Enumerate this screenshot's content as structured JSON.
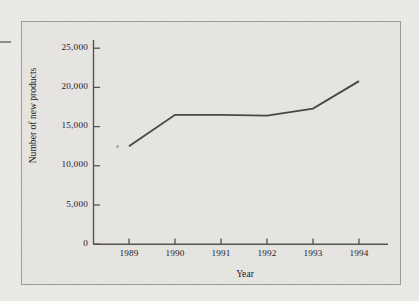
{
  "chart_data": {
    "type": "line",
    "title": "",
    "xlabel": "Year",
    "ylabel": "Number of new products",
    "categories": [
      "1989",
      "1990",
      "1991",
      "1992",
      "1993",
      "1994"
    ],
    "x": [
      1989,
      1990,
      1991,
      1992,
      1993,
      1994
    ],
    "values": [
      12500,
      16500,
      16500,
      16400,
      17300,
      20800
    ],
    "series": [
      {
        "name": "Number of new products",
        "values": [
          12500,
          16500,
          16500,
          16400,
          17300,
          20800
        ]
      }
    ],
    "ylim": [
      0,
      25000
    ],
    "ytick_values": [
      0,
      5000,
      10000,
      15000,
      20000,
      25000
    ],
    "ytick_labels": [
      "0",
      "5,000",
      "10,000",
      "15,000",
      "20,000",
      "25,000"
    ],
    "xtick_labels": [
      "1989",
      "1990",
      "1991",
      "1992",
      "1993",
      "1994"
    ],
    "grid": false,
    "legend": null,
    "legend_position": "none",
    "line_color": "#4a4845",
    "markers": false,
    "annotations": []
  },
  "figure": {
    "background_color": "#e6e4e1",
    "page_background_color": "#eceae7",
    "frame_color": "#9c9a97",
    "axis_color": "#55534f",
    "text_color": "#23211f"
  }
}
